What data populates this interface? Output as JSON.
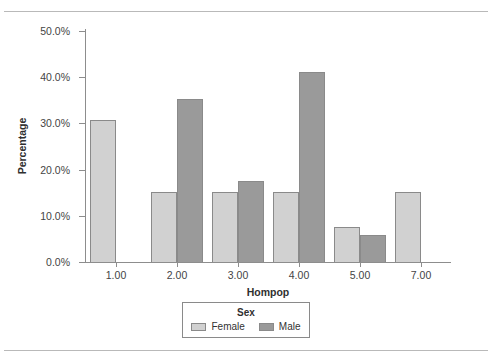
{
  "chart_data": {
    "type": "bar",
    "title": "",
    "xlabel": "Hompop",
    "ylabel": "Percentage",
    "categories": [
      "1.00",
      "2.00",
      "3.00",
      "4.00",
      "5.00",
      "7.00"
    ],
    "series": [
      {
        "name": "Female",
        "color": "#d1d1d1",
        "values": [
          30.8,
          15.2,
          15.2,
          15.2,
          7.6,
          15.2
        ]
      },
      {
        "name": "Male",
        "color": "#9a9a9a",
        "values": [
          0,
          35.2,
          17.6,
          41.1,
          5.9,
          0
        ]
      }
    ],
    "ylim": [
      0,
      50
    ],
    "ytick_labels": [
      "0.0%",
      "10.0%",
      "20.0%",
      "30.0%",
      "40.0%",
      "50.0%"
    ],
    "ytick_values": [
      0,
      10,
      20,
      30,
      40,
      50
    ],
    "grid": false,
    "legend": {
      "title": "Sex",
      "position": "bottom",
      "entries": [
        {
          "label": "Female",
          "color": "#d1d1d1"
        },
        {
          "label": "Male",
          "color": "#9a9a9a"
        }
      ]
    }
  }
}
